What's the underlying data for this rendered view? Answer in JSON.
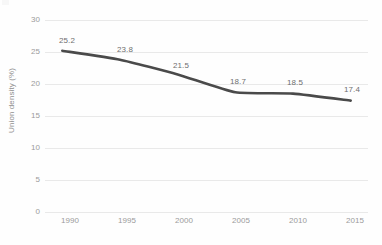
{
  "chart_data": {
    "type": "line",
    "title": "",
    "xlabel": "",
    "ylabel": "Union density (%)",
    "categories": [
      "1990",
      "1995",
      "2000",
      "2005",
      "2010",
      "2015"
    ],
    "x": [
      1990,
      1995,
      2000,
      2005,
      2010,
      2015
    ],
    "values": [
      25.2,
      23.8,
      21.5,
      18.7,
      18.5,
      17.4
    ],
    "point_labels": [
      "25.2",
      "23.8",
      "21.5",
      "18.7",
      "18.5",
      "17.4"
    ],
    "ylim": [
      0,
      30
    ],
    "y_ticks": [
      0,
      5,
      10,
      15,
      20,
      25,
      30
    ],
    "y_tick_labels": [
      "0",
      "5",
      "10",
      "15",
      "20",
      "25",
      "30"
    ],
    "xlim": [
      1988.5,
      2016.5
    ],
    "grid": "horizontal",
    "legend": "none",
    "series": [
      {
        "name": "Union density (%)",
        "values": [
          25.2,
          23.8,
          21.5,
          18.7,
          18.5,
          17.4
        ],
        "color": "#4a4a4a",
        "smooth": true,
        "line_width": 2.6,
        "markers": "none"
      }
    ],
    "colors": {
      "line": "#4a4a4a",
      "gridline": "#e9e9e9",
      "background": "#fefefe",
      "tick_text": "#9b9b9b",
      "axis_title_text": "#8f8f8f",
      "data_label_text": "#6e6e6e"
    }
  }
}
